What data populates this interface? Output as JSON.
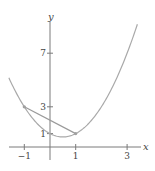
{
  "chart_data": {
    "type": "line",
    "title": "",
    "xlabel": "x",
    "ylabel": "y",
    "xlim": [
      -1.7,
      3.6
    ],
    "ylim": [
      -0.6,
      10.3
    ],
    "x_ticks": [
      {
        "value": -1,
        "label": "−1"
      },
      {
        "value": 1,
        "label": "1"
      },
      {
        "value": 3,
        "label": "3"
      }
    ],
    "y_ticks": [
      {
        "value": 1,
        "label": "1"
      },
      {
        "value": 3,
        "label": "3"
      },
      {
        "value": 7,
        "label": "7"
      }
    ],
    "grid": false,
    "series": [
      {
        "name": "curve",
        "function": "x^2 - x + 1",
        "x_range": [
          -1.6,
          3.4
        ],
        "color": "#a9a9a9"
      },
      {
        "name": "secant",
        "points": [
          [
            -1,
            3
          ],
          [
            1,
            1
          ]
        ],
        "color": "#9a9a9a"
      }
    ],
    "marked_points": [
      [
        -1,
        3
      ],
      [
        1,
        1
      ]
    ]
  }
}
